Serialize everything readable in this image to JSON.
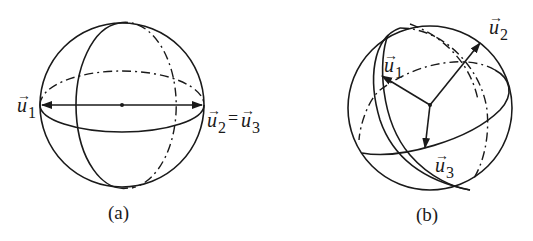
{
  "figure": {
    "panel_a": {
      "caption": "(a)",
      "vectors": [
        {
          "name": "u",
          "subscript": "1"
        },
        {
          "name": "u",
          "subscript": "2"
        },
        {
          "name": "u",
          "subscript": "3"
        }
      ],
      "equals": "="
    },
    "panel_b": {
      "caption": "(b)",
      "vectors": [
        {
          "name": "u",
          "subscript": "1"
        },
        {
          "name": "u",
          "subscript": "2"
        },
        {
          "name": "u",
          "subscript": "3"
        }
      ]
    },
    "vector_arrow_glyph": "→"
  }
}
